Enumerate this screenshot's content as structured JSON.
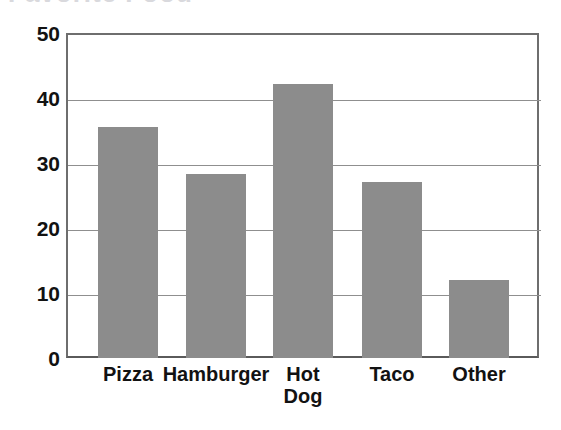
{
  "figure": {
    "cropped_title_remnant": "Favorite Food",
    "bar_color": "#8c8c8c",
    "axis_color": "#6e6e6e",
    "grid_color": "#8f8f8f",
    "label_color": "#121212"
  },
  "chart_data": {
    "type": "bar",
    "title": "",
    "subtitle": "",
    "xlabel": "",
    "ylabel": "",
    "categories": [
      "Pizza",
      "Hamburger",
      "Hot Dog",
      "Taco",
      "Other"
    ],
    "values": [
      35.5,
      28.3,
      42.2,
      27.0,
      12.0
    ],
    "ylim": [
      0,
      50
    ],
    "yticks": [
      0,
      10,
      20,
      30,
      40,
      50
    ],
    "ytick_labels": [
      "0",
      "10",
      "20",
      "30",
      "40",
      "50"
    ],
    "grid": true,
    "grid_axis": "y",
    "legend": false,
    "legend_position": "none",
    "bars": [
      {
        "label": "Pizza",
        "value": 35.5
      },
      {
        "label": "Hamburger",
        "value": 28.3
      },
      {
        "label": "Hot Dog",
        "value": 42.2
      },
      {
        "label": "Taco",
        "value": 27.0
      },
      {
        "label": "Other",
        "value": 12.0
      }
    ]
  },
  "yticks": {
    "t50": "50",
    "t40": "40",
    "t30": "30",
    "t20": "20",
    "t10": "10",
    "t0": "0"
  },
  "xticks": {
    "pizza": "Pizza",
    "hamburger": "Hamburger",
    "hotdog_line1": "Hot",
    "hotdog_line2": "Dog",
    "taco": "Taco",
    "other": "Other"
  }
}
